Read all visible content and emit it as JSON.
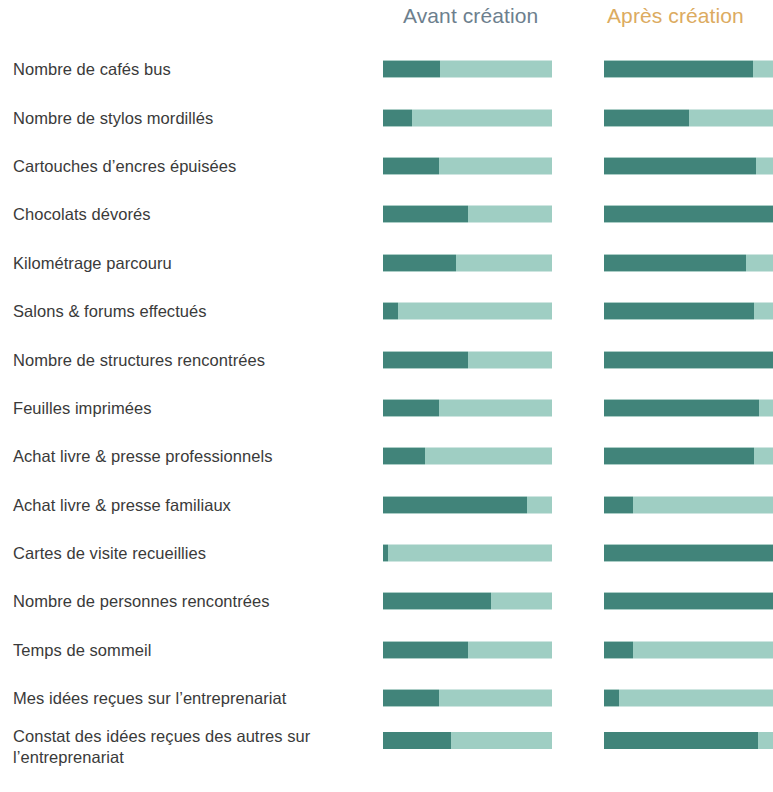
{
  "header": {
    "before_label": "Avant création",
    "after_label": "Après création"
  },
  "colors": {
    "fill_dark": "#41847a",
    "track_light": "#9fcec3",
    "header_before": "#6d7f8e",
    "header_after": "#dcab60",
    "label_text": "#3a3a3a",
    "background": "#ffffff"
  },
  "chart_data": {
    "type": "bar",
    "title": "",
    "subtitle": "",
    "xlabel": "",
    "ylabel": "",
    "xlim": [
      0,
      100
    ],
    "grid": false,
    "legend_position": "top",
    "orientation": "horizontal",
    "style": "stacked-progress",
    "categories": [
      "Nombre de cafés bus",
      "Nombre de stylos mordillés",
      "Cartouches d’encres épuisées",
      "Chocolats dévorés",
      "Kilométrage parcouru",
      "Salons & forums effectués",
      "Nombre de structures rencontrées",
      "Feuilles imprimées",
      "Achat livre & presse professionnels",
      "Achat livre & presse familiaux",
      "Cartes de visite recueillies",
      "Nombre de personnes rencontrées",
      "Temps de sommeil",
      "Mes idées reçues sur l’entreprenariat",
      "Constat des idées reçues  des autres sur l’entreprenariat"
    ],
    "series": [
      {
        "name": "Avant création",
        "values": [
          34,
          17,
          33,
          50,
          43,
          9,
          50,
          33,
          25,
          85,
          3,
          64,
          50,
          33,
          40
        ]
      },
      {
        "name": "Après création",
        "values": [
          88,
          50,
          90,
          100,
          84,
          89,
          100,
          92,
          89,
          17,
          100,
          100,
          17,
          9,
          91
        ]
      }
    ]
  },
  "rows": [
    {
      "label": "Nombre de cafés bus",
      "before": 34,
      "after": 88,
      "two_line": false
    },
    {
      "label": "Nombre de stylos mordillés",
      "before": 17,
      "after": 50,
      "two_line": false
    },
    {
      "label": "Cartouches d’encres épuisées",
      "before": 33,
      "after": 90,
      "two_line": false
    },
    {
      "label": "Chocolats dévorés",
      "before": 50,
      "after": 100,
      "two_line": false
    },
    {
      "label": "Kilométrage parcouru",
      "before": 43,
      "after": 84,
      "two_line": false
    },
    {
      "label": "Salons & forums effectués",
      "before": 9,
      "after": 89,
      "two_line": false
    },
    {
      "label": "Nombre de structures rencontrées",
      "before": 50,
      "after": 100,
      "two_line": false
    },
    {
      "label": "Feuilles imprimées",
      "before": 33,
      "after": 92,
      "two_line": false
    },
    {
      "label": "Achat livre & presse professionnels",
      "before": 25,
      "after": 89,
      "two_line": false
    },
    {
      "label": "Achat livre & presse familiaux",
      "before": 85,
      "after": 17,
      "two_line": false
    },
    {
      "label": "Cartes de visite recueillies",
      "before": 3,
      "after": 100,
      "two_line": false
    },
    {
      "label": "Nombre de personnes rencontrées",
      "before": 64,
      "after": 100,
      "two_line": false
    },
    {
      "label": "Temps de sommeil",
      "before": 50,
      "after": 17,
      "two_line": false
    },
    {
      "label": "Mes idées reçues sur l’entreprenariat",
      "before": 33,
      "after": 9,
      "two_line": false
    },
    {
      "label": "Constat des idées reçues  des autres sur l’entreprenariat",
      "before": 40,
      "after": 91,
      "two_line": true
    }
  ]
}
